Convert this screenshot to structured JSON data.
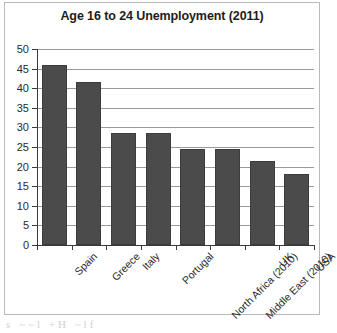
{
  "chart_data": {
    "type": "bar",
    "title": "Age 16 to 24 Unemployment (2011)",
    "xlabel": "",
    "ylabel": "",
    "categories": [
      "Spain",
      "Greece",
      "Italy",
      "Portugal",
      "North Africa (2010)",
      "Middle East (2010)",
      "UK",
      "USA"
    ],
    "values": [
      46,
      41.5,
      28.5,
      28.5,
      24.5,
      24.5,
      21.5,
      18
    ],
    "ylim": [
      0,
      50
    ],
    "ytick_step": 5,
    "yticks": [
      0,
      5,
      10,
      15,
      20,
      25,
      30,
      35,
      40,
      45,
      50
    ],
    "ytick_labels": [
      "0",
      "5",
      "10",
      "15",
      "20",
      "25",
      "30",
      "35",
      "40",
      "45",
      "50"
    ],
    "grid": true,
    "legend": false,
    "bar_color": "#4b4b4b",
    "bar_edge_color": "#3c3c3c",
    "gridline_color": "#9a9a9a",
    "axis_color": "#3a3a3a",
    "xtick_label_rotation": -45
  },
  "artifact": {
    "bottom_text": "s  ~~l  +H ~lf"
  }
}
